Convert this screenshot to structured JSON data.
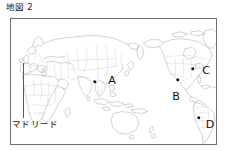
{
  "figure": {
    "title": "地図 2",
    "frame": {
      "x": 10,
      "y": 18,
      "width": 207,
      "height": 127,
      "border_color": "#6e6e6e"
    }
  },
  "map": {
    "projection_note": "Pacific-centered world map, coastlines and national borders",
    "coast_color": "#8d8d8d",
    "border_color": "#b4b4b4",
    "ocean_color": "#ffffff",
    "land_color": "#ffffff"
  },
  "annotations": {
    "madrid": {
      "label": "マドリード",
      "label_x": 12,
      "label_y": 119,
      "leader": {
        "x": 23,
        "y_top": 63,
        "y_bottom": 118
      }
    },
    "points": [
      {
        "id": "A",
        "label": "A",
        "marker_x": 95,
        "marker_y": 82,
        "label_x": 112,
        "label_y": 80
      },
      {
        "id": "B",
        "label": "B",
        "marker_x": 178,
        "marker_y": 80,
        "label_x": 176,
        "label_y": 96
      },
      {
        "id": "C",
        "label": "C",
        "marker_x": 193,
        "marker_y": 69,
        "label_x": 206,
        "label_y": 70
      },
      {
        "id": "D",
        "label": "D",
        "marker_x": 199,
        "marker_y": 118,
        "label_x": 210,
        "label_y": 124
      }
    ]
  }
}
